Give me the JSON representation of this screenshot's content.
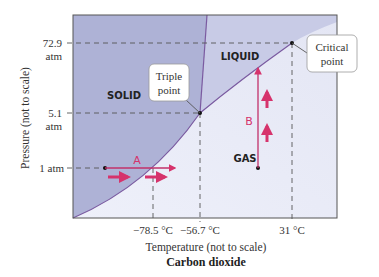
{
  "diagram": {
    "title": "Carbon dioxide",
    "xlabel": "Temperature (not to scale)",
    "ylabel": "Pressure (not to scale)",
    "y_ticks": [
      {
        "line1": "72.9",
        "line2": "atm"
      },
      {
        "line1": "5.1",
        "line2": "atm"
      },
      {
        "line1": "1 atm",
        "line2": ""
      }
    ],
    "x_ticks": [
      "−78.5 °C",
      "−56.7 °C",
      "31 °C"
    ],
    "regions": {
      "solid": "SOLID",
      "liquid": "LIQUID",
      "gas": "GAS"
    },
    "callouts": {
      "triple_line1": "Triple",
      "triple_line2": "point",
      "critical_line1": "Critical",
      "critical_line2": "point"
    },
    "paths": {
      "a": "A",
      "b": "B"
    },
    "colors": {
      "solid": "#aeb2d6",
      "liquid": "#c8cbe6",
      "gas": "#eceef8",
      "boundary": "#7a5aa0",
      "arrow": "#d6336c",
      "dash": "#555555"
    }
  }
}
